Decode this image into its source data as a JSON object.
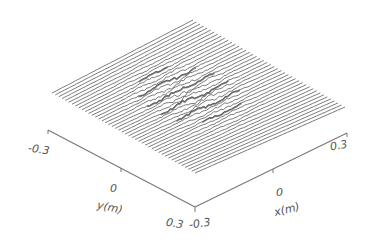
{
  "chart_data": {
    "type": "surface",
    "title": "",
    "xlabel": "x(m)",
    "ylabel": "y(m)",
    "zlabel": "",
    "xlim": [
      -0.3,
      0.3
    ],
    "ylim": [
      -0.3,
      0.3
    ],
    "x_ticks": [
      "-0.3",
      "0",
      "0.3"
    ],
    "y_ticks": [
      "-0.3",
      "0",
      "0.3"
    ],
    "grid": false,
    "legend": null,
    "profile_line_count": 44,
    "surface_character": "mostly flat with irregular rough features concentrated in the central region"
  },
  "axes": {
    "y_axis": {
      "label": "y(m)",
      "tick_min": "-0.3",
      "tick_mid": "0",
      "tick_max": "0.3"
    },
    "x_axis": {
      "label": "x(m)",
      "tick_min": "-0.3",
      "tick_mid": "0",
      "tick_max": "0.3"
    }
  },
  "style": {
    "line_color": "#6a6a6a",
    "rough_line_color": "#4a4a4a",
    "axis_color": "#777777",
    "background": "#ffffff"
  }
}
